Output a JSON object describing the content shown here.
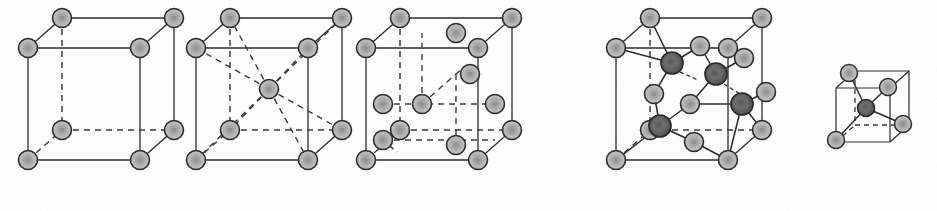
{
  "figure": {
    "panels": [
      {
        "id": "a",
        "label": "(a)",
        "x": 18,
        "y": 8
      },
      {
        "id": "b",
        "label": "(b)",
        "x": 600,
        "y": 8
      }
    ],
    "structures": [
      {
        "name": "sc",
        "caption": "sc",
        "caption_x": 85,
        "caption_y": 10,
        "origin_x": 28,
        "origin_y": 36,
        "cube_w": 112,
        "cube_h": 112,
        "depth_x": 34,
        "depth_y": -30,
        "atoms_corner": 8,
        "atoms_body_center": 0,
        "atoms_face_center": 0,
        "atom_radius": 9.5,
        "description": "simple cubic lattice, atoms at 8 cube corners only"
      },
      {
        "name": "bcc",
        "caption": "bcc",
        "caption_x": 252,
        "caption_y": 10,
        "origin_x": 196,
        "origin_y": 36,
        "cube_w": 112,
        "cube_h": 112,
        "depth_x": 34,
        "depth_y": -30,
        "atoms_corner": 8,
        "atoms_body_center": 1,
        "atoms_face_center": 0,
        "atom_radius": 9.5,
        "description": "body-centred cubic lattice, 8 corner atoms plus 1 body-centre atom joined to corners by dashed bonds"
      },
      {
        "name": "fcc",
        "caption": "fcc",
        "caption_x": 424,
        "caption_y": 10,
        "origin_x": 366,
        "origin_y": 36,
        "cube_w": 112,
        "cube_h": 112,
        "depth_x": 34,
        "depth_y": -30,
        "atoms_corner": 8,
        "atoms_body_center": 0,
        "atoms_face_center": 6,
        "atom_radius": 9.5,
        "description": "face-centred cubic lattice, 8 corner atoms plus 6 face-centre atoms"
      },
      {
        "name": "zincblende",
        "caption": "Zincblende/diamond",
        "caption_x": 660,
        "caption_y": 8,
        "origin_x": 616,
        "origin_y": 36,
        "cube_w": 112,
        "cube_h": 112,
        "depth_x": 34,
        "depth_y": -30,
        "atoms_corner": 8,
        "atoms_body_center": 0,
        "atoms_face_center": 6,
        "atoms_tetrahedral": 4,
        "atom_radius": 9.5,
        "atom_radius_dark": 11,
        "description": "zincblende / diamond structure: two interpenetrating fcc sublattices, 4 dark tetrahedral interior atoms each bonded to 4 neighbours"
      },
      {
        "name": "tetrahedron-inset",
        "caption": "",
        "caption_x": 0,
        "caption_y": 0,
        "origin_x": 836,
        "origin_y": 70,
        "cube_w": 54,
        "cube_h": 54,
        "depth_x": 19,
        "depth_y": -17,
        "atoms_corner": 4,
        "atoms_body_center": 1,
        "atom_radius": 8.5,
        "atom_radius_dark": 8.5,
        "description": "inset small cube showing one tetrahedral bonding unit: dark central atom bonded to four light corner atoms"
      }
    ],
    "style": {
      "atom_fill_light": "#b9b9b9",
      "atom_fill_light_center": "#8e8e8e",
      "atom_fill_dark": "#6f6f6f",
      "atom_fill_dark_center": "#4a4a4a",
      "atom_stroke": "#2e2e2e",
      "bond_solid_color": "#2b2b2b",
      "bond_dashed_color": "#3a3a3a",
      "background": "#fefefe",
      "text_color": "#2b2b2b"
    }
  }
}
